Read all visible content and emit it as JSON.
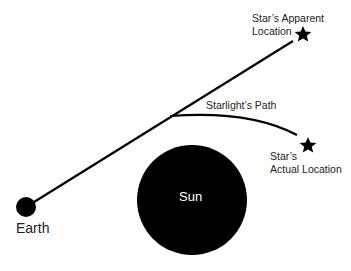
{
  "labels": {
    "apparent_line1": "Star’s Apparent",
    "apparent_line2": "Location",
    "path": "Starlight’s Path",
    "actual_line1": "Star’s",
    "actual_line2": "Actual Location",
    "sun": "Sun",
    "earth": "Earth"
  },
  "colors": {
    "body": "#000000",
    "line": "#000000",
    "text": "#222222",
    "sun_text": "#ffffff"
  }
}
